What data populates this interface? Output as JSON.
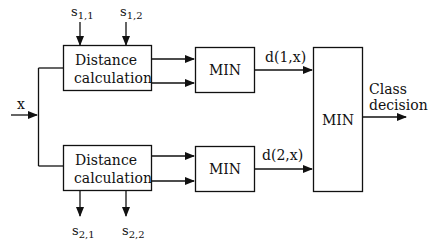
{
  "diagram": {
    "input_label": "x",
    "blocks": {
      "dist1": {
        "line1": "Distance",
        "line2": "calculation"
      },
      "dist2": {
        "line1": "Distance",
        "line2": "calculation"
      },
      "min1": "MIN",
      "min2": "MIN",
      "min_final": "MIN"
    },
    "signals": {
      "s11": {
        "base": "s",
        "sub": "1,1"
      },
      "s12": {
        "base": "s",
        "sub": "1,2"
      },
      "s21": {
        "base": "s",
        "sub": "2,1"
      },
      "s22": {
        "base": "s",
        "sub": "2,2"
      },
      "d1": "d(1,x)",
      "d2": "d(2,x)"
    },
    "output_label": {
      "line1": "Class",
      "line2": "decision"
    }
  }
}
